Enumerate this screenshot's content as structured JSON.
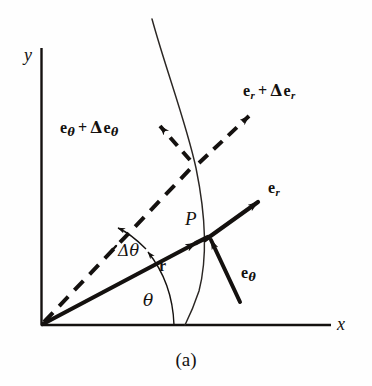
{
  "figure": {
    "caption": "(a)",
    "axes": {
      "x_label": "x",
      "y_label": "y"
    },
    "point_label": "P",
    "angles": [
      {
        "name": "theta",
        "label": "θ"
      },
      {
        "name": "delta-theta",
        "label": "Δθ"
      }
    ],
    "vectors": [
      {
        "name": "r",
        "base": "r",
        "sub": "",
        "full_label": "r",
        "style": "solid"
      },
      {
        "name": "e-r",
        "base": "e",
        "sub": "r",
        "full_label": "e r",
        "style": "solid"
      },
      {
        "name": "e-theta",
        "base": "e",
        "sub": "θ",
        "full_label": "e θ",
        "style": "solid"
      },
      {
        "name": "e-r-plus-delta-e-r",
        "base": "e",
        "sub": "r",
        "op": "+",
        "delta": "Δ",
        "base2": "e",
        "sub2": "r",
        "style": "dashed"
      },
      {
        "name": "e-theta-plus-delta-e-theta",
        "base": "e",
        "sub": "θ",
        "op": "+",
        "delta": "Δ",
        "base2": "e",
        "sub2": "θ",
        "style": "dashed"
      }
    ],
    "colors": {
      "ink": "#14110f",
      "background": "#fefefe",
      "curve": "#2a2623"
    }
  }
}
